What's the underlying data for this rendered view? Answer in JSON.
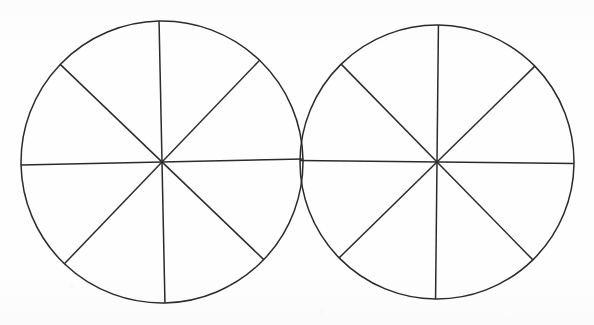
{
  "figure": {
    "background_color": "#fefefe",
    "stroke_color": "#2b2b2b",
    "stroke_width": 1.5,
    "canvas": {
      "width": 594,
      "height": 325
    },
    "shape_count": 2,
    "sectors_per_shape": 8,
    "fraction_per_sector": "1/8",
    "divider_angles_deg": [
      0,
      45,
      90,
      135
    ],
    "shapes": [
      {
        "name": "left-circle",
        "label": "Circle 1",
        "center_x": 162,
        "center_y": 162,
        "radius": 141,
        "rotation_deg": -1.2,
        "sectors": 8,
        "filled_sectors": 0,
        "fill": "none"
      },
      {
        "name": "right-circle",
        "label": "Circle 2",
        "center_x": 437,
        "center_y": 162,
        "radius": 137,
        "rotation_deg": 0.6,
        "sectors": 8,
        "filled_sectors": 0,
        "fill": "none"
      }
    ]
  },
  "chart_data": {
    "type": "pie",
    "title": "",
    "xlabel": "",
    "ylabel": "",
    "legend_position": "none",
    "grid": false,
    "charts": [
      {
        "name": "left-circle",
        "categories": [
          "1/8",
          "1/8",
          "1/8",
          "1/8",
          "1/8",
          "1/8",
          "1/8",
          "1/8"
        ],
        "values": [
          12.5,
          12.5,
          12.5,
          12.5,
          12.5,
          12.5,
          12.5,
          12.5
        ],
        "shaded": [
          0,
          0,
          0,
          0,
          0,
          0,
          0,
          0
        ],
        "total": 100
      },
      {
        "name": "right-circle",
        "categories": [
          "1/8",
          "1/8",
          "1/8",
          "1/8",
          "1/8",
          "1/8",
          "1/8",
          "1/8"
        ],
        "values": [
          12.5,
          12.5,
          12.5,
          12.5,
          12.5,
          12.5,
          12.5,
          12.5
        ],
        "shaded": [
          0,
          0,
          0,
          0,
          0,
          0,
          0,
          0
        ],
        "total": 100
      }
    ]
  }
}
